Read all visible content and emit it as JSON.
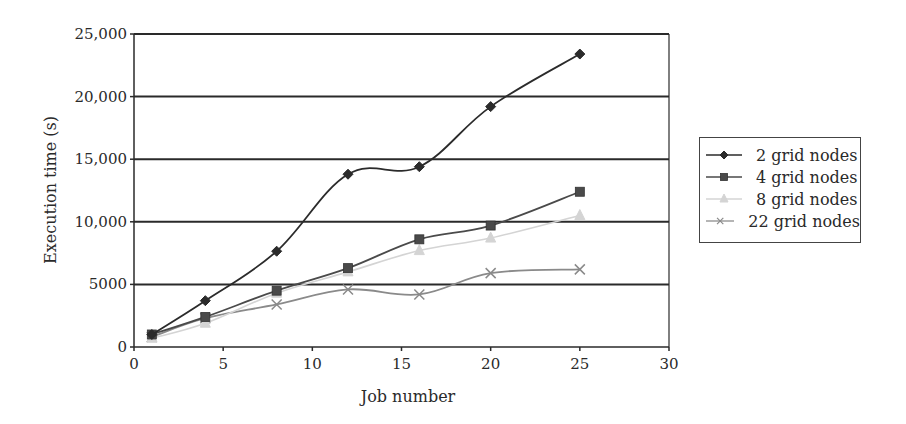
{
  "chart_data": {
    "type": "line",
    "title": "",
    "xlabel": "Job number",
    "ylabel": "Execution time (s)",
    "xlim": [
      0,
      30
    ],
    "ylim": [
      0,
      25000
    ],
    "x_ticks": [
      0,
      5,
      10,
      15,
      20,
      25,
      30
    ],
    "y_ticks": [
      0,
      5000,
      10000,
      15000,
      20000,
      25000
    ],
    "y_tick_labels": [
      "0",
      "5000",
      "10,000",
      "15,000",
      "20,000",
      "25,000"
    ],
    "x_tick_labels": [
      "0",
      "5",
      "10",
      "15",
      "20",
      "25",
      "30"
    ],
    "grid": "horizontal",
    "legend_position": "right",
    "x": [
      1,
      4,
      8,
      12,
      16,
      20,
      25
    ],
    "series": [
      {
        "name": "2 grid nodes",
        "marker": "diamond",
        "color": "#2b2b2b",
        "values": [
          1000,
          3700,
          7650,
          13800,
          14400,
          19200,
          23400
        ]
      },
      {
        "name": "4 grid nodes",
        "marker": "square",
        "color": "#4a4a4a",
        "values": [
          1000,
          2400,
          4500,
          6300,
          8600,
          9700,
          12400
        ]
      },
      {
        "name": "8 grid nodes",
        "marker": "triangle",
        "color": "#d4d4d4",
        "values": [
          700,
          1900,
          4300,
          6000,
          7700,
          8700,
          10500
        ]
      },
      {
        "name": "22 grid nodes",
        "marker": "x",
        "color": "#8a8a8a",
        "values": [
          800,
          2300,
          3400,
          4600,
          4200,
          5900,
          6200
        ]
      }
    ]
  }
}
